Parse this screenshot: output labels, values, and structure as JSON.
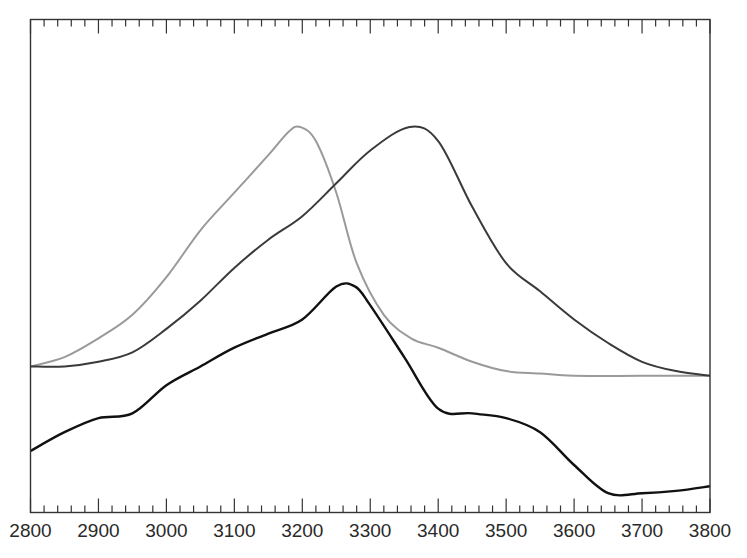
{
  "chart_data": {
    "type": "line",
    "title": "",
    "xlabel": "",
    "ylabel": "",
    "xlim": [
      2800,
      3800
    ],
    "ylim": [
      0,
      1
    ],
    "grid": false,
    "legend": null,
    "x_ticks": [
      "2800",
      "2900",
      "3000",
      "3100",
      "3200",
      "3300",
      "3400",
      "3500",
      "3600",
      "3700",
      "3800"
    ],
    "minor_ticks_per_major": 4,
    "series": [
      {
        "name": "gray-curve",
        "color": "#9a9a9a",
        "x": [
          2800,
          2850,
          2900,
          2950,
          3000,
          3050,
          3100,
          3150,
          3180,
          3197,
          3220,
          3250,
          3280,
          3320,
          3360,
          3400,
          3450,
          3500,
          3550,
          3600,
          3700,
          3800
        ],
        "y": [
          0.31,
          0.33,
          0.37,
          0.42,
          0.5,
          0.6,
          0.68,
          0.76,
          0.81,
          0.82,
          0.79,
          0.68,
          0.53,
          0.42,
          0.37,
          0.35,
          0.32,
          0.3,
          0.295,
          0.29,
          0.29,
          0.29
        ]
      },
      {
        "name": "dark-curve",
        "color": "#3a3a3a",
        "x": [
          2800,
          2850,
          2900,
          2950,
          3000,
          3050,
          3100,
          3150,
          3200,
          3250,
          3300,
          3358,
          3400,
          3450,
          3500,
          3550,
          3600,
          3650,
          3700,
          3750,
          3800
        ],
        "y": [
          0.31,
          0.31,
          0.32,
          0.34,
          0.39,
          0.45,
          0.52,
          0.58,
          0.63,
          0.7,
          0.77,
          0.82,
          0.79,
          0.65,
          0.53,
          0.47,
          0.41,
          0.36,
          0.32,
          0.3,
          0.29
        ]
      },
      {
        "name": "black-curve",
        "color": "#111111",
        "x": [
          2800,
          2850,
          2900,
          2950,
          3000,
          3050,
          3100,
          3150,
          3200,
          3250,
          3278,
          3300,
          3350,
          3400,
          3450,
          3500,
          3550,
          3600,
          3650,
          3700,
          3750,
          3800
        ],
        "y": [
          0.13,
          0.17,
          0.2,
          0.21,
          0.27,
          0.31,
          0.35,
          0.38,
          0.41,
          0.48,
          0.48,
          0.44,
          0.33,
          0.22,
          0.21,
          0.2,
          0.17,
          0.1,
          0.04,
          0.04,
          0.045,
          0.055
        ]
      }
    ]
  }
}
